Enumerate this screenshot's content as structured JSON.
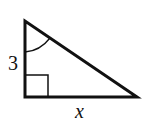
{
  "diagram": {
    "type": "right-triangle",
    "labels": {
      "vertical_leg": "3",
      "horizontal_leg": "x"
    },
    "marks": {
      "right_angle": "bottom-left",
      "angle_arc": "top vertex"
    },
    "colors": {
      "stroke": "#111111",
      "background": "#ffffff"
    }
  }
}
